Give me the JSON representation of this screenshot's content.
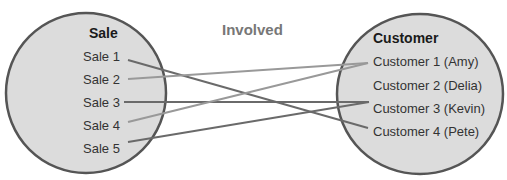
{
  "relationship": {
    "label": "Involved"
  },
  "left_set": {
    "title": "Sale",
    "items": [
      "Sale 1",
      "Sale 2",
      "Sale 3",
      "Sale 4",
      "Sale 5"
    ]
  },
  "right_set": {
    "title": "Customer",
    "items": [
      "Customer 1 (Amy)",
      "Customer 2 (Delia)",
      "Customer 3 (Kevin)",
      "Customer 4 (Pete)"
    ]
  },
  "mappings": [
    {
      "from": "Sale 1",
      "to": "Customer 4 (Pete)"
    },
    {
      "from": "Sale 2",
      "to": "Customer 1 (Amy)"
    },
    {
      "from": "Sale 3",
      "to": "Customer 3 (Kevin)"
    },
    {
      "from": "Sale 4",
      "to": "Customer 1 (Amy)"
    },
    {
      "from": "Sale 5",
      "to": "Customer 3 (Kevin)"
    }
  ],
  "colors": {
    "circle_fill": "#dcdcdc",
    "circle_stroke": "#555555",
    "line_dark": "#6a6a6a",
    "line_light": "#999999"
  }
}
